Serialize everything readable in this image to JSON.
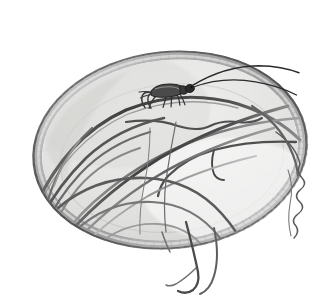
{
  "image": {
    "title": "Cricket on grass blades inside a shallow woven bowl",
    "medium": "graphite pencil and ink wash illustration",
    "palette": "grayscale",
    "width": 334,
    "height": 304
  },
  "canvas": {
    "background_color": "#ffffff"
  },
  "bowl": {
    "name": "shallow woven bowl",
    "center_x": 170,
    "center_y": 150,
    "radius_x": 136,
    "radius_y": 97,
    "rotation_deg": -6,
    "rim_outer_color": "#6d6d6d",
    "rim_band_color": "#b4b4b4",
    "rim_band_light_color": "#dcdcdc",
    "interior_top_color": "#e8e8e6",
    "interior_bottom_color": "#f7f7f6",
    "interior_shadow_color": "#d6d6d4",
    "rim_weave_tick_color": "#8a8a8a",
    "rim_weave_tick_count": 96,
    "inner_ellipse_color": "#a8a8a8"
  },
  "cricket": {
    "name": "cricket",
    "body_color": "#3b3b3b",
    "outline_color": "#1f1f1f",
    "highlight_color": "#9a9a9a",
    "position_x": 168,
    "position_y": 92,
    "body_length": 34,
    "antenna_count": 2,
    "leg_count": 6,
    "antenna_color": "#2a2a2a",
    "antenna_reach_x": 300
  },
  "grass": {
    "name": "grass blades",
    "blade_count": 14,
    "dark_color": "#4a4a4a",
    "mid_color": "#6f6f6f",
    "light_color": "#9b9b9b",
    "wispy_color": "#575757",
    "description": "long curving blades sweeping from upper-right to lower-left, several trailing past the bowl rim at bottom and one curly tendril at right"
  },
  "labels": {
    "alt_text": "Pencil drawing of a cricket perched on arching grass blades that fill a shallow round woven basket."
  }
}
